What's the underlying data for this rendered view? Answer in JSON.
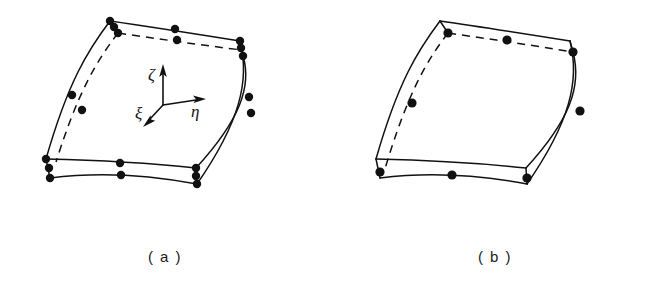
{
  "figure": {
    "background_color": "#ffffff",
    "line_color": "#111111",
    "node_color": "#111111",
    "panels": [
      {
        "id": "a",
        "caption": "(a)",
        "element_name": "20-node quadratic hexahedron",
        "corner_node_count": 8,
        "midside_node_count": 12,
        "total_node_count": 20,
        "has_axes": true
      },
      {
        "id": "b",
        "caption": "(b)",
        "element_name": "8-node hexahedron with midside nodes on visible edges",
        "corner_node_count": 8,
        "midside_node_count": 6,
        "total_node_count": 14,
        "has_axes": false
      }
    ]
  },
  "axes": {
    "origin_label": "",
    "items": [
      {
        "symbol": "ζ",
        "name": "zeta",
        "direction": "up",
        "label_x": 152,
        "label_y": 76
      },
      {
        "symbol": "η",
        "name": "eta",
        "direction": "right",
        "label_x": 193,
        "label_y": 112
      },
      {
        "symbol": "ξ",
        "name": "xi",
        "direction": "down-left",
        "label_x": 142,
        "label_y": 116
      }
    ]
  },
  "captions": {
    "a": "( a )",
    "b": "( b )"
  },
  "geometry_a": {
    "top_face_front": "M 110,21 C 152,27 196,34 240,41",
    "top_face_back": "M 110,21 C 88,50 68,82 46,159",
    "hidden_top_back": "M 118,33 C 160,39 200,45 242,50",
    "hidden_left_back": "M 118,33 C 96,62 78,92 56,162",
    "bottom_face_front": "M 50,166 C 92,161 140,163 195,173",
    "bottom_face_front_lower": "M 50,177 C 92,172 140,174 196,184",
    "right_front": "M 240,41 C 252,72 242,108 196,184",
    "right_back": "M 242,50 C 254,80 244,114 198,175",
    "left_vertical_a": "M 46,159 L 50,166",
    "left_vertical_b": "M 50,166 L 50,177",
    "right_vertical": "M 240,41 L 243,57"
  },
  "geometry_b": {
    "top_face_front": "M 440,21 C 482,27 526,34 570,41",
    "top_face_back": "M 440,21 C 418,50 398,82 376,159",
    "hidden_top_back": "M 448,33 C 490,39 530,45 572,50",
    "hidden_left_back": "M 448,33 C 426,62 408,92 386,162",
    "bottom_face_front": "M 380,166 C 422,161 470,163 525,173",
    "bottom_face_front_lower": "M 380,177 C 422,172 470,174 526,184",
    "right_front": "M 570,41 C 582,72 572,108 526,184",
    "right_back": "M 572,50 C 584,80 574,114 528,175"
  },
  "nodes_a": [
    {
      "id": "n1",
      "type": "corner",
      "x": 110,
      "y": 21,
      "r": 4.2
    },
    {
      "id": "n2",
      "type": "midside",
      "x": 114,
      "y": 27,
      "r": 4.2
    },
    {
      "id": "n3",
      "type": "corner",
      "x": 118,
      "y": 33,
      "r": 4.2
    },
    {
      "id": "n4",
      "type": "midside",
      "x": 175,
      "y": 29,
      "r": 4.2
    },
    {
      "id": "n5",
      "type": "midside",
      "x": 177,
      "y": 40,
      "r": 4.2
    },
    {
      "id": "n6",
      "type": "corner",
      "x": 240,
      "y": 41,
      "r": 4.2
    },
    {
      "id": "n7",
      "type": "midside",
      "x": 241,
      "y": 48,
      "r": 4.2
    },
    {
      "id": "n8",
      "type": "corner",
      "x": 243,
      "y": 56,
      "r": 4.2
    },
    {
      "id": "n9",
      "type": "midside",
      "x": 72,
      "y": 95,
      "r": 4.2
    },
    {
      "id": "n10",
      "type": "midside",
      "x": 82,
      "y": 110,
      "r": 4.2
    },
    {
      "id": "n11",
      "type": "midside",
      "x": 249,
      "y": 97,
      "r": 4.2
    },
    {
      "id": "n12",
      "type": "midside",
      "x": 251,
      "y": 113,
      "r": 4.2
    },
    {
      "id": "n13",
      "type": "corner",
      "x": 46,
      "y": 159,
      "r": 4.2
    },
    {
      "id": "n14",
      "type": "midside",
      "x": 49,
      "y": 168,
      "r": 4.2
    },
    {
      "id": "n15",
      "type": "corner",
      "x": 50,
      "y": 178,
      "r": 4.2
    },
    {
      "id": "n16",
      "type": "midside",
      "x": 120,
      "y": 163,
      "r": 4.2
    },
    {
      "id": "n17",
      "type": "midside",
      "x": 121,
      "y": 175,
      "r": 4.2
    },
    {
      "id": "n18",
      "type": "corner",
      "x": 196,
      "y": 168,
      "r": 4.2
    },
    {
      "id": "n19",
      "type": "midside",
      "x": 196,
      "y": 176,
      "r": 4.2
    },
    {
      "id": "n20",
      "type": "corner",
      "x": 197,
      "y": 184,
      "r": 4.2
    }
  ],
  "nodes_b": [
    {
      "id": "m1",
      "type": "midside",
      "x": 448,
      "y": 33,
      "r": 4.6
    },
    {
      "id": "m2",
      "type": "midside",
      "x": 507,
      "y": 40,
      "r": 4.6
    },
    {
      "id": "m3",
      "type": "midside",
      "x": 573,
      "y": 52,
      "r": 4.6
    },
    {
      "id": "m4",
      "type": "midside",
      "x": 412,
      "y": 103,
      "r": 4.6
    },
    {
      "id": "m5",
      "type": "midside",
      "x": 580,
      "y": 111,
      "r": 4.6
    },
    {
      "id": "m6",
      "type": "midside",
      "x": 380,
      "y": 172,
      "r": 4.6
    },
    {
      "id": "m7",
      "type": "midside",
      "x": 452,
      "y": 175,
      "r": 4.6
    },
    {
      "id": "m8",
      "type": "midside",
      "x": 527,
      "y": 178,
      "r": 4.6
    }
  ]
}
